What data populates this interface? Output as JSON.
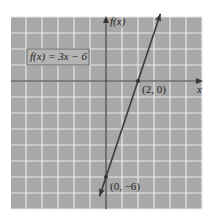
{
  "chart_data": {
    "type": "line",
    "title": "",
    "function_label": "f(x) = 3x − 6",
    "xlabel": "x",
    "ylabel": "f(x)",
    "xlim": [
      -6,
      6
    ],
    "ylim": [
      -8,
      4
    ],
    "grid": true,
    "series": [
      {
        "name": "f(x) = 3x − 6",
        "slope": 3,
        "intercept": -6,
        "x": [
          -0.4,
          2,
          3.4
        ],
        "y": [
          -7.2,
          0,
          4.2
        ]
      }
    ],
    "points": [
      {
        "x": 2,
        "y": 0,
        "label": "(2, 0)"
      },
      {
        "x": 0,
        "y": -6,
        "label": "(0, −6)"
      }
    ],
    "colors": {
      "background": "#a9a9a9",
      "grid": "#e6e6e6",
      "axis": "#333333",
      "line": "#3a3a3a"
    }
  }
}
